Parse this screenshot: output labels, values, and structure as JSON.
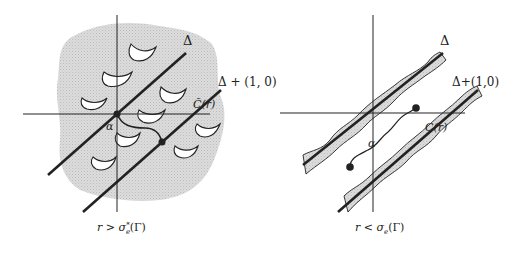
{
  "panels": [
    {
      "id": "left",
      "caption": "r > σₑ*(Γ)",
      "caption_main": "r > σ",
      "caption_sub": "e",
      "caption_sup": "*",
      "caption_tail": "(Γ)",
      "line_label_1": "Δ",
      "line_label_2": "Δ + (1, 0)",
      "curve_label": "C̃(r)",
      "origin_label": "α",
      "shading": "gray region with white holes"
    },
    {
      "id": "right",
      "caption": "r < σₑ(Γ)",
      "caption_main": "r < σ",
      "caption_sub": "e",
      "caption_tail": "(Γ)",
      "line_label_1": "Δ",
      "line_label_2": "Δ+(1,0)",
      "curve_label": "C(r)",
      "origin_label": "α",
      "shading": "gray bands along lines"
    }
  ],
  "colors": {
    "ink": "#222222",
    "shade": "#d4d4d4",
    "hole": "#ffffff"
  }
}
